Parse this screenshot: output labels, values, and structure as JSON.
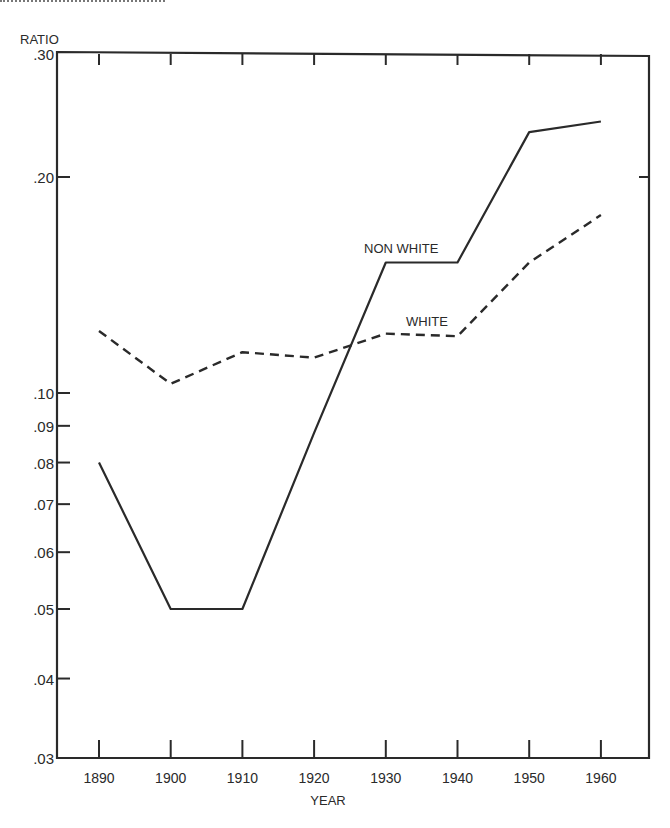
{
  "chart_data": {
    "type": "line",
    "title": "",
    "xlabel": "YEAR",
    "ylabel": "RATIO",
    "yscale": "log",
    "ylim": [
      0.03,
      0.3
    ],
    "xlim": [
      1885,
      1963
    ],
    "grid": false,
    "x": [
      1890,
      1900,
      1910,
      1920,
      1930,
      1940,
      1950,
      1960
    ],
    "x_ticks": [
      "1890",
      "1900",
      "1910",
      "1920",
      "1930",
      "1940",
      "1950",
      "1960"
    ],
    "y_ticks": [
      {
        "value": 0.3,
        "label": ".30"
      },
      {
        "value": 0.2,
        "label": ".20"
      },
      {
        "value": 0.1,
        "label": ".10"
      },
      {
        "value": 0.09,
        "label": ".09"
      },
      {
        "value": 0.08,
        "label": ".08"
      },
      {
        "value": 0.07,
        "label": ".07"
      },
      {
        "value": 0.06,
        "label": ".06"
      },
      {
        "value": 0.05,
        "label": ".05"
      },
      {
        "value": 0.04,
        "label": ".04"
      },
      {
        "value": 0.03,
        "label": ".03"
      }
    ],
    "series": [
      {
        "name": "NON WHITE",
        "style": "solid",
        "values": [
          0.08,
          0.05,
          0.05,
          0.088,
          0.152,
          0.152,
          0.231,
          0.239
        ]
      },
      {
        "name": "WHITE",
        "style": "dashed",
        "values": [
          0.122,
          0.103,
          0.114,
          0.112,
          0.121,
          0.12,
          0.152,
          0.177
        ]
      }
    ],
    "annotations": [
      {
        "text": "NON WHITE",
        "near": {
          "x": 1935,
          "y": 0.16
        }
      },
      {
        "text": "WHITE",
        "near": {
          "x": 1935,
          "y": 0.125
        }
      }
    ],
    "legend": "inline labels"
  },
  "labels": {
    "ylabel": "RATIO",
    "xlabel": "YEAR",
    "nonwhite": "NON WHITE",
    "white": "WHITE"
  },
  "colors": {
    "ink": "#2a2a2a",
    "background": "#ffffff"
  }
}
